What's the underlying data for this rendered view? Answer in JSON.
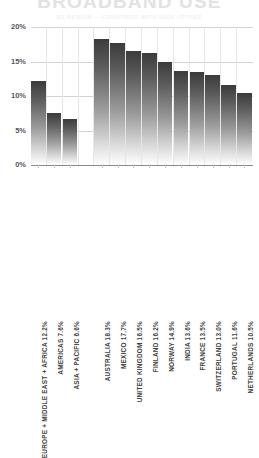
{
  "header": {
    "title": "BROADBAND USE",
    "subtitle": "BY REGION — COUNTRIES WITH HIGH UPTAKE"
  },
  "axis": {
    "y_ticks": [
      "0%",
      "5%",
      "10%",
      "15%",
      "20%"
    ],
    "y_min": 0,
    "y_max": 20
  },
  "chart_data": {
    "type": "bar",
    "title": "BROADBAND USE",
    "subtitle": "BY REGION — COUNTRIES WITH HIGH UPTAKE",
    "xlabel": "",
    "ylabel": "",
    "ylim": [
      0,
      20
    ],
    "yticks": [
      0,
      5,
      10,
      15,
      20
    ],
    "ytick_labels": [
      "0%",
      "5%",
      "10%",
      "15%",
      "20%"
    ],
    "grid": true,
    "legend": false,
    "value_unit": "%",
    "groups": [
      {
        "name": "regions",
        "categories": [
          "EUROPE + MIDDLE EAST + AFRICA",
          "AMERICAS",
          "ASIA + PACIFIC"
        ],
        "values": [
          12.2,
          7.6,
          6.6
        ],
        "labels": [
          "EUROPE + MIDDLE EAST + AFRICA 12.2%",
          "AMERICAS 7.6%",
          "ASIA + PACIFIC 6.6%"
        ]
      },
      {
        "name": "countries",
        "categories": [
          "AUSTRALIA",
          "MEXICO",
          "UNITED KINGDOM",
          "FINLAND",
          "NORWAY",
          "INDIA",
          "FRANCE",
          "SWITZERLAND",
          "PORTUGAL",
          "NETHERLANDS"
        ],
        "values": [
          18.3,
          17.7,
          16.5,
          16.2,
          14.9,
          13.6,
          13.5,
          13.0,
          11.6,
          10.5
        ],
        "labels": [
          "AUSTRALIA 18.3%",
          "MEXICO 17.7%",
          "UNITED KINGDOM 16.5%",
          "FINLAND 16.2%",
          "NORWAY 14.9%",
          "INDIA 13.6%",
          "FRANCE 13.5%",
          "SWITZERLAND 13.0%",
          "PORTUGAL 11.6%",
          "NETHERLANDS 10.5%"
        ]
      }
    ],
    "colors": {
      "bar_gradient_top": "#3b3b3b",
      "bar_gradient_bottom": "#ffffff",
      "gridline": "#d2d2d2",
      "baseline": "#8a8a8a",
      "tick_label": "#58585a",
      "category_label": "#3f3f41",
      "title": "#e2e2e2",
      "background": "#ffffff"
    }
  }
}
